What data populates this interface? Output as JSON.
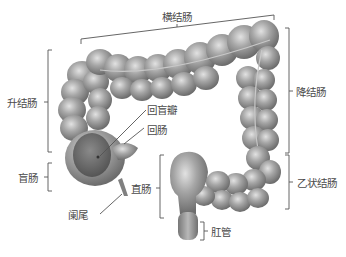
{
  "diagram": {
    "colors": {
      "organ_fill": "#9a9a9a",
      "organ_highlight": "#d8d8d8",
      "organ_shadow": "#6a6a6a",
      "cecum_inner": "#6e6e6e",
      "bracket": "#555555",
      "text": "#4a4a4a"
    },
    "labels": {
      "transverse_colon": "横结肠",
      "ascending_colon": "升结肠",
      "descending_colon": "降结肠",
      "ileocecal_valve": "回盲瓣",
      "ileum": "回肠",
      "cecum": "盲肠",
      "rectum": "直肠",
      "sigmoid_colon": "乙状结肠",
      "appendix": "阑尾",
      "anal_canal": "肛管"
    }
  }
}
